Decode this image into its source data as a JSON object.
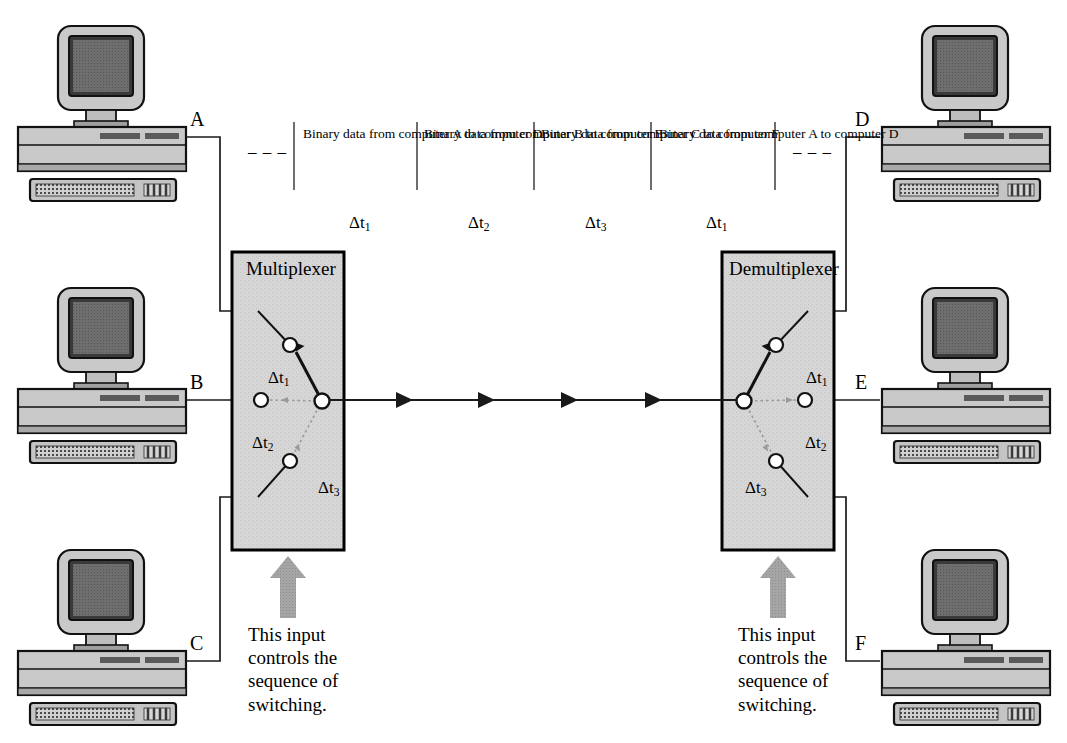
{
  "figure": {
    "kind": "time-division-multiplexing-diagram",
    "colors": {
      "box_fill": "#d4d4d4",
      "box_border": "#000000",
      "line": "#1a1a1a",
      "screen": "#6e6e6e",
      "case": "#c9c9c9",
      "case_dark": "#a8a8a8",
      "control_arrow": "#9a9a9a",
      "dashed_switch": "#9a9a9a"
    }
  },
  "left_computers": [
    {
      "label": "A",
      "name": "computer-a"
    },
    {
      "label": "B",
      "name": "computer-b"
    },
    {
      "label": "C",
      "name": "computer-c"
    }
  ],
  "right_computers": [
    {
      "label": "D",
      "name": "computer-d"
    },
    {
      "label": "E",
      "name": "computer-e"
    },
    {
      "label": "F",
      "name": "computer-f"
    }
  ],
  "timeline": {
    "leading_ellipsis": "– – –",
    "trailing_ellipsis": "– – –",
    "slots": [
      {
        "text": "Binary data from computer A to computer D",
        "tick": "Δt",
        "tick_sub": "1"
      },
      {
        "text": "Binary data from computer B to computer E",
        "tick": "Δt",
        "tick_sub": "2"
      },
      {
        "text": "Binary data from computer C to computer F",
        "tick": "Δt",
        "tick_sub": "3"
      },
      {
        "text": "Binary data from computer A to computer D",
        "tick": "Δt",
        "tick_sub": "1"
      }
    ]
  },
  "multiplexer": {
    "title": "Multiplexer",
    "contacts": [
      {
        "tick": "Δt",
        "tick_sub": "1",
        "state": "connected"
      },
      {
        "tick": "Δt",
        "tick_sub": "2",
        "state": "idle"
      },
      {
        "tick": "Δt",
        "tick_sub": "3",
        "state": "idle"
      }
    ],
    "control_note": "This input\ncontrols the\nsequence of\nswitching."
  },
  "demultiplexer": {
    "title": "Demultiplexer",
    "contacts": [
      {
        "tick": "Δt",
        "tick_sub": "1",
        "state": "connected"
      },
      {
        "tick": "Δt",
        "tick_sub": "2",
        "state": "idle"
      },
      {
        "tick": "Δt",
        "tick_sub": "3",
        "state": "idle"
      }
    ],
    "control_note": "This input\ncontrols the\nsequence of\nswitching."
  },
  "trunk": {
    "arrow_count": 4,
    "direction": "left-to-right"
  }
}
